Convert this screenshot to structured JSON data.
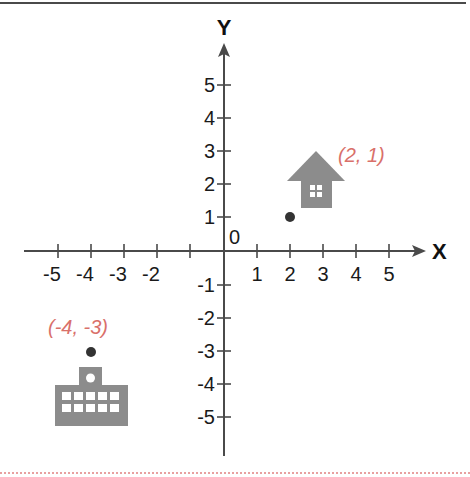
{
  "diagram": {
    "type": "coordinate-plane",
    "axes": {
      "x_label": "X",
      "y_label": "Y",
      "origin_label": "0",
      "x_ticks": [
        "-5",
        "-4",
        "-3",
        "-2",
        "",
        "1",
        "2",
        "3",
        "4",
        "5"
      ],
      "y_ticks": [
        "5",
        "4",
        "3",
        "2",
        "1",
        "-1",
        "-2",
        "-3",
        "-4",
        "-5"
      ],
      "range": [
        -5,
        5
      ]
    },
    "points": [
      {
        "label": "(2, 1)",
        "x": 2,
        "y": 1,
        "icon": "house-icon"
      },
      {
        "label": "(-4, -3)",
        "x": -4,
        "y": -3,
        "icon": "school-building-icon"
      }
    ],
    "colors": {
      "axis": "#4a4a4a",
      "icon": "#8c8c8c",
      "point": "#333333",
      "coordinate_label": "#d9706a",
      "bottom_rule": "#e8a0a0"
    }
  }
}
